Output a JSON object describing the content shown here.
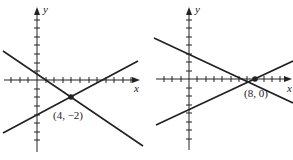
{
  "graphs": [
    {
      "id": "left",
      "x_axis_label": "x",
      "y_axis_label": "y",
      "intersection_label": "(4, −2)",
      "intersection": [
        4,
        -2
      ],
      "lines": [
        {
          "slope": -0.75,
          "intercept": 1
        },
        {
          "slope": 0.5,
          "intercept": -4
        }
      ]
    },
    {
      "id": "right",
      "x_axis_label": "x",
      "y_axis_label": "y",
      "intersection_label": "(8, 0)",
      "intersection": [
        8,
        0
      ],
      "lines": [
        {
          "slope": -0.375,
          "intercept": 3
        },
        {
          "slope": 0.375,
          "intercept": -3
        }
      ]
    }
  ],
  "colors": {
    "ink": "#222222",
    "background": "#ffffff"
  }
}
